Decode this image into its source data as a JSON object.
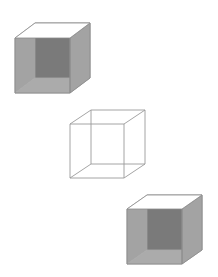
{
  "figure": {
    "colors": {
      "background": "#ffffff",
      "side_face": "#a3a3a3",
      "bottom_face": "#ababab",
      "back_face": "#7a7a7a",
      "top_face": "#ffffff",
      "edge": "#8c8c8c",
      "wire_edge": "#9a9a9a"
    },
    "cubes": [
      {
        "name": "open-shaded-cube-top-left",
        "style": "shaded",
        "front": {
          "x": 15,
          "y": 38,
          "size": 55
        },
        "depth_offset": {
          "dx": 20,
          "dy": -15
        }
      },
      {
        "name": "wireframe-cube-center",
        "style": "wireframe",
        "front": {
          "x": 70,
          "y": 124,
          "size": 54
        },
        "depth_offset": {
          "dx": 21,
          "dy": -14
        }
      },
      {
        "name": "open-shaded-cube-bottom-right",
        "style": "shaded",
        "front": {
          "x": 127,
          "y": 209,
          "size": 55
        },
        "depth_offset": {
          "dx": 20,
          "dy": -14
        }
      }
    ]
  }
}
